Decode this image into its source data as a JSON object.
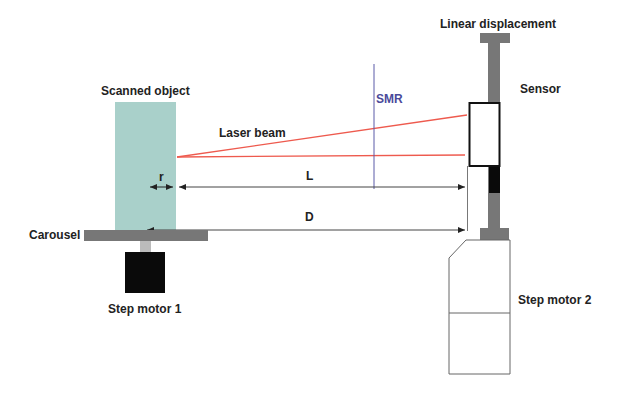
{
  "diagram": {
    "labels": {
      "scanned_object": "Scanned object",
      "laser_beam": "Laser beam",
      "smr": "SMR",
      "linear_displacement": "Linear displacement",
      "sensor": "Sensor",
      "r": "r",
      "L": "L",
      "D": "D",
      "carousel": "Carousel",
      "step_motor_1": "Step motor 1",
      "step_motor_2": "Step motor 2"
    },
    "colors": {
      "object_fill": "#a9d0ca",
      "laser": "#ee5a4e",
      "smr_line": "#5a5aa8",
      "metal_gray": "#777777",
      "light_gray": "#bbbbbb",
      "motor_black": "#0a0a0a",
      "outline": "#333333"
    }
  }
}
